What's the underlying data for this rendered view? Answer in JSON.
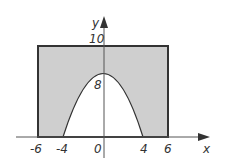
{
  "diagram": {
    "type": "region-between-rectangle-and-parabola",
    "axes": {
      "x_label": "x",
      "y_label": "y"
    },
    "x_ticks": [
      "-6",
      "-4",
      "0",
      "4",
      "6"
    ],
    "y_ticks": [
      "10",
      "8"
    ],
    "rectangle": {
      "x_min": -6,
      "x_max": 6,
      "y_min": 0,
      "y_max": 10
    },
    "parabola": {
      "vertex": [
        0,
        8
      ],
      "roots": [
        -4,
        4
      ]
    },
    "colors": {
      "shade": "#cfcfcf",
      "line": "#333333",
      "background": "#ffffff"
    }
  }
}
